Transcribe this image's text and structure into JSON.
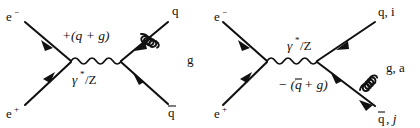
{
  "figure": {
    "type": "feynman-diagram-pair",
    "background_color": "#ffffff",
    "line_color": "#111111"
  },
  "diagrams": [
    {
      "id": "left",
      "name": "quark-gluon-emission",
      "incoming": [
        {
          "name": "electron",
          "label": "e",
          "superscript": "−"
        },
        {
          "name": "positron",
          "label": "e",
          "superscript": "+"
        }
      ],
      "propagator": {
        "name": "photon-z-propagator",
        "label": "γ",
        "superscript": "*",
        "suffix": "/Z"
      },
      "current_label": "+(q + g)",
      "outgoing": [
        {
          "name": "quark",
          "label": "q"
        },
        {
          "name": "antiquark",
          "label": "q",
          "bar": true
        },
        {
          "name": "gluon",
          "label": "g"
        }
      ]
    },
    {
      "id": "right",
      "name": "antiquark-gluon-emission",
      "incoming": [
        {
          "name": "electron",
          "label": "e",
          "superscript": "−"
        },
        {
          "name": "positron",
          "label": "e",
          "superscript": "+"
        }
      ],
      "propagator": {
        "name": "photon-z-propagator",
        "label": "γ",
        "superscript": "*",
        "suffix": "/Z"
      },
      "current_label": "− (q̄ + g)",
      "current_label_parts": {
        "sign": "−",
        "open": "(",
        "bar_symbol": "q",
        "plus": "+",
        "gluon": "g",
        "close": ")"
      },
      "outgoing": [
        {
          "name": "quark",
          "label": "q, i"
        },
        {
          "name": "antiquark",
          "label": "q̄, j",
          "bar": true
        },
        {
          "name": "gluon",
          "label": "g, a"
        }
      ]
    }
  ],
  "labels": {
    "left": {
      "electron": "e",
      "electron_sup": "−",
      "positron": "e",
      "positron_sup": "+",
      "propagator_gamma": "γ",
      "propagator_star": "*",
      "propagator_slash_z": "/Z",
      "current": "+(q + g)",
      "quark": "q",
      "antiquark": "q",
      "gluon": "g"
    },
    "right": {
      "electron": "e",
      "electron_sup": "−",
      "positron": "e",
      "positron_sup": "+",
      "propagator_gamma": "γ",
      "propagator_star": "*",
      "propagator_slash_z": "/Z",
      "current_sign": "− (",
      "current_qbar": "q",
      "current_rest": "+ g)",
      "quark": "q, i",
      "antiquark": "q",
      "antiquark_index": ", j",
      "gluon": "g, a"
    }
  }
}
